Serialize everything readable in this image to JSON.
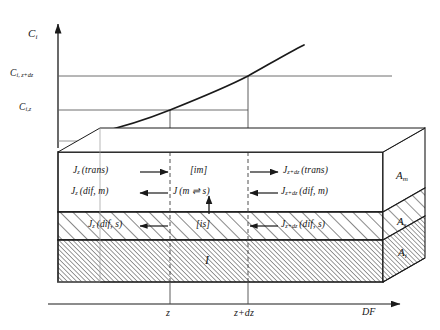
{
  "figure": {
    "axes": {
      "y_label": "C",
      "y_label_sub": "i",
      "x_label": "DF",
      "x_ticks": [
        {
          "label": "z"
        },
        {
          "label": "z+dz"
        }
      ],
      "y_levels": [
        {
          "label": "C",
          "sub": "i, z+dz"
        },
        {
          "label": "C",
          "sub": "i,z"
        }
      ]
    },
    "mobile_zone": {
      "phase_tag": "[im]",
      "inflow_trans": "J",
      "inflow_trans_sub": "z",
      "inflow_trans_paren": "(trans)",
      "inflow_dif": "J",
      "inflow_dif_sub": "z",
      "inflow_dif_paren": "(dif, m)",
      "outflow_trans": "J",
      "outflow_trans_sub": "z+dz",
      "outflow_trans_paren": "(trans)",
      "outflow_dif": "J",
      "outflow_dif_sub": "z+dz",
      "outflow_dif_paren": "(dif, m)",
      "exchange": "J",
      "exchange_paren": "(m ⇌ s)"
    },
    "stagnant_zone": {
      "phase_tag": "[is]",
      "inflow_dif": "J",
      "inflow_dif_sub": "z",
      "inflow_dif_paren": "(dif, s)",
      "outflow_dif": "J",
      "outflow_dif_sub": "z+dz",
      "outflow_dif_paren": "(dif, s)"
    },
    "immobile_zone": {
      "label": "I"
    },
    "areas": [
      {
        "label": "A",
        "sub": "m"
      },
      {
        "label": "A",
        "sub": "s"
      },
      {
        "label": "A",
        "sub": "i"
      }
    ],
    "colors": {
      "line": "#1a1a1a",
      "thin_line": "#6b6b6b",
      "hatch": "#2a2a2a",
      "background": "#ffffff"
    }
  }
}
